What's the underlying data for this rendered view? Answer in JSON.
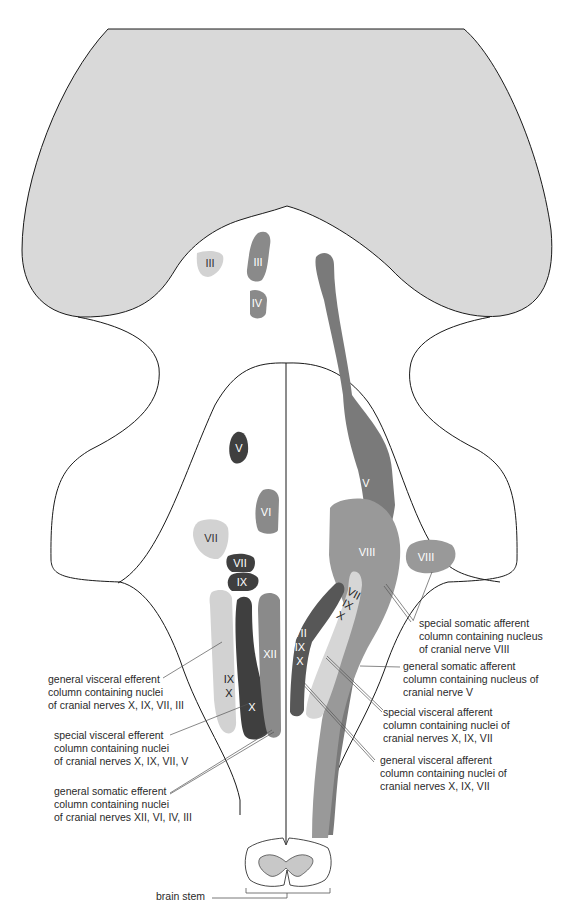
{
  "colors": {
    "midbrain_fill": "#d9d9d9",
    "outline": "#1a1a1a",
    "gse": "#8a8a8a",
    "gve": "#d2d2d2",
    "sve": "#3f3f3f",
    "gsa": "#7a7a7a",
    "ssa": "#999999",
    "sva": "#d6d6d6",
    "gva": "#575757",
    "cord_gray": "#c8c8c8"
  },
  "nuclei_labels": {
    "iii_gve": "III",
    "iii_gse": "III",
    "iv_gse": "IV",
    "v_sve": "V",
    "vi_gse": "VI",
    "vii_gve": "VII",
    "vii_sve": "VII",
    "ix_sve": "IX",
    "xii_gse": "XII",
    "ix_gve": "IX",
    "x_gve": "X",
    "x_sve": "X",
    "v_gsa": "V",
    "viii_ssa_medial": "VIII",
    "viii_ssa_lateral": "VIII",
    "vii_sva": "VII",
    "ix_sva": "IX",
    "x_sva": "X",
    "vii_gva": "VII",
    "ix_gva": "IX",
    "x_gva": "X"
  },
  "labels": {
    "gve": [
      "general visceral efferent",
      "column containing nuclei",
      "of cranial nerves X, IX, VII, III"
    ],
    "sve": [
      "special visceral efferent",
      "column containing nuclei",
      "of cranial nerves X, IX, VII, V"
    ],
    "gse": [
      "general somatic efferent",
      "column containing nuclei",
      "of cranial nerves  XII, VI, IV, III"
    ],
    "ssa": [
      "special somatic afferent",
      "column containing nucleus",
      "of cranial nerve VIII"
    ],
    "gsa": [
      "general somatic afferent",
      "column containing nucleus of",
      "cranial nerve V"
    ],
    "sva": [
      "special visceral afferent",
      "column containing nuclei of",
      "cranial nerves X, IX, VII"
    ],
    "gva": [
      "general visceral afferent",
      "column containing nuclei of",
      "cranial nerves X, IX, VII"
    ],
    "brain_stem": "brain stem"
  }
}
